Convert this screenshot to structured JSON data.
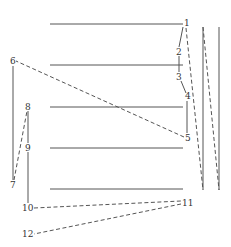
{
  "diagram": {
    "type": "stroke-path-over-staff",
    "colors": {
      "line": "#555555",
      "label": "#333333",
      "background": "#ffffff"
    },
    "horizontal_lines": [
      {
        "x1": 50,
        "x2": 183,
        "y": 24
      },
      {
        "x1": 50,
        "x2": 183,
        "y": 65
      },
      {
        "x1": 50,
        "x2": 183,
        "y": 107
      },
      {
        "x1": 50,
        "x2": 183,
        "y": 148
      },
      {
        "x1": 50,
        "x2": 183,
        "y": 189
      }
    ],
    "points": [
      {
        "label": "1",
        "x": 184,
        "y": 26
      },
      {
        "label": "2",
        "x": 176,
        "y": 55
      },
      {
        "label": "3",
        "x": 176,
        "y": 80
      },
      {
        "label": "4",
        "x": 185,
        "y": 99
      },
      {
        "label": "5",
        "x": 185,
        "y": 141
      },
      {
        "label": "6",
        "x": 10,
        "y": 64
      },
      {
        "label": "7",
        "x": 10,
        "y": 188
      },
      {
        "label": "8",
        "x": 25,
        "y": 110
      },
      {
        "label": "9",
        "x": 25,
        "y": 151
      },
      {
        "label": "10",
        "x": 22,
        "y": 211
      },
      {
        "label": "11",
        "x": 182,
        "y": 206
      },
      {
        "label": "12",
        "x": 22,
        "y": 237
      }
    ],
    "segments": [
      {
        "from": "1",
        "to": "2",
        "style": "solid"
      },
      {
        "from": "2",
        "to": "3",
        "style": "solid"
      },
      {
        "from": "3",
        "to": "4",
        "style": "solid"
      },
      {
        "from": "4",
        "to": "5",
        "style": "solid"
      },
      {
        "from": "5",
        "to": "6",
        "style": "dashed"
      },
      {
        "from": "6",
        "to": "7",
        "style": "solid"
      },
      {
        "from": "7",
        "to": "8",
        "style": "dashed"
      },
      {
        "from": "8",
        "to": "9",
        "style": "solid"
      },
      {
        "from": "9",
        "to": "10",
        "style": "solid"
      },
      {
        "from": "10",
        "to": "11",
        "style": "dashed"
      },
      {
        "from": "11",
        "to": "12",
        "style": "dashed"
      }
    ],
    "right_strokes": [
      {
        "x1": 186,
        "y1": 28,
        "x2": 203,
        "y2": 190,
        "style": "dashed"
      },
      {
        "x1": 203,
        "y1": 27,
        "x2": 203,
        "y2": 190,
        "style": "solid"
      },
      {
        "x1": 203,
        "y1": 27,
        "x2": 219,
        "y2": 190,
        "style": "dashed"
      },
      {
        "x1": 219,
        "y1": 27,
        "x2": 219,
        "y2": 190,
        "style": "solid"
      }
    ]
  }
}
